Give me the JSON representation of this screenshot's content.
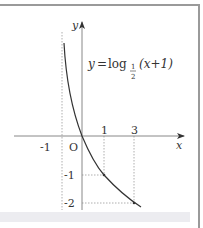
{
  "figure": {
    "equation": {
      "lhs": "y",
      "eq": "=",
      "func": "log",
      "base_num": "1",
      "base_den": "2",
      "arg": "(x+1)"
    },
    "axis_labels": {
      "x": "x",
      "y": "y",
      "origin": "O"
    },
    "x_ticks": [
      {
        "label": "-1",
        "value": -1
      },
      {
        "label": "1",
        "value": 1
      },
      {
        "label": "3",
        "value": 3
      }
    ],
    "y_ticks": [
      {
        "label": "-1",
        "value": -1
      },
      {
        "label": "-2",
        "value": -2
      }
    ],
    "marked_points": [
      {
        "x": 0,
        "y": 0
      },
      {
        "x": 1,
        "y": -1
      },
      {
        "x": 3,
        "y": -2
      }
    ],
    "asymptote": "x = -1",
    "colors": {
      "curve": "#333333",
      "axis": "#888888",
      "guide": "#9a9a9a",
      "frame": "#9a9a9a"
    }
  }
}
